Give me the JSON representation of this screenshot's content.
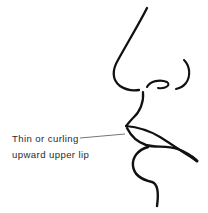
{
  "figure": {
    "annotation": {
      "line1": "Thin or curling",
      "line2": "upward upper lip"
    },
    "colors": {
      "stroke": "#111111",
      "leader": "#777777",
      "text": "#2a2a2a",
      "background": "#ffffff"
    }
  }
}
